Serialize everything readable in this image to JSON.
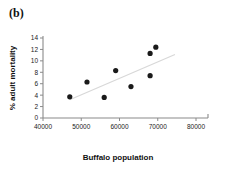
{
  "figure": {
    "panel_label": "(b)"
  },
  "chart_data": {
    "type": "scatter",
    "title": "",
    "subtitle": "",
    "xlabel": "Buffalo population",
    "ylabel": "% adult mortality",
    "xlim": [
      40000,
      80000
    ],
    "ylim": [
      0,
      14
    ],
    "xticks": [
      40000,
      50000,
      60000,
      70000,
      80000
    ],
    "yticks": [
      0,
      2,
      4,
      6,
      8,
      10,
      12,
      14
    ],
    "xtick_labels": [
      "40000",
      "50000",
      "60000",
      "70000",
      "80000"
    ],
    "ytick_labels": [
      "0",
      "2",
      "4",
      "6",
      "8",
      "10",
      "12",
      "14"
    ],
    "grid": false,
    "legend": null,
    "marker": "filled-circle",
    "marker_color": "#1a1a1a",
    "points": [
      {
        "x": 47000,
        "y": 3.7
      },
      {
        "x": 51500,
        "y": 6.3
      },
      {
        "x": 56000,
        "y": 3.6
      },
      {
        "x": 59000,
        "y": 8.3
      },
      {
        "x": 63000,
        "y": 5.5
      },
      {
        "x": 68000,
        "y": 7.4
      },
      {
        "x": 68000,
        "y": 11.3
      },
      {
        "x": 69500,
        "y": 12.4
      }
    ],
    "trend_line": {
      "visible": true,
      "color": "#d8d8d8",
      "x_start": 47000,
      "y_start": 3.2,
      "x_end": 74500,
      "y_end": 11.1
    }
  }
}
